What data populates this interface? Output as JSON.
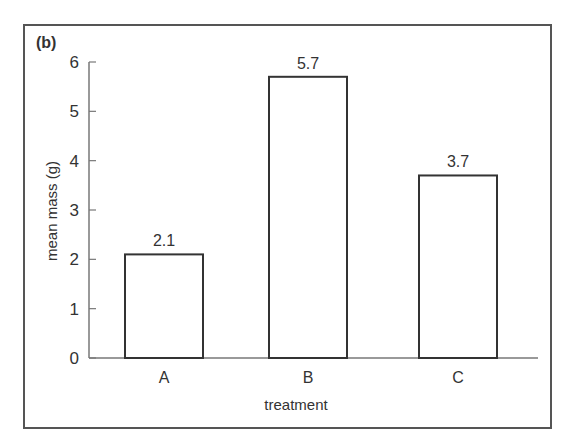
{
  "chart_data": {
    "type": "bar",
    "panel_label": "(b)",
    "title": "",
    "categories": [
      "A",
      "B",
      "C"
    ],
    "values": [
      2.1,
      5.7,
      3.7
    ],
    "data_labels": [
      "2.1",
      "5.7",
      "3.7"
    ],
    "xlabel": "treatment",
    "ylabel": "mean mass (g)",
    "ylim": [
      0,
      6
    ],
    "yticks": [
      0,
      1,
      2,
      3,
      4,
      5,
      6
    ],
    "grid": false,
    "legend": null,
    "bar_fill": "#ffffff",
    "bar_edge": "#333333"
  }
}
